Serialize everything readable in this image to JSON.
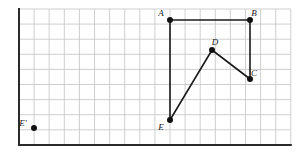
{
  "figure": {
    "background_color": "#ffffff",
    "grid": {
      "line_color": "#c9c9c9",
      "border_color": "#2b2b2b",
      "cell_size": 15.1,
      "origin_x": 19,
      "origin_y": 9,
      "columns": 18,
      "rows": 9,
      "left_axis": true,
      "bottom_axis": true
    },
    "shape": {
      "stroke_color": "#1a1a1a",
      "stroke_width": 1.6,
      "fill": "none",
      "closed": true,
      "point_radius": 3.0,
      "point_color": "#111111",
      "vertices": [
        {
          "label": "A",
          "x": 170,
          "y": 20,
          "label_dx": -9,
          "label_dy": -4
        },
        {
          "label": "B",
          "x": 250,
          "y": 20,
          "label_dx": 4,
          "label_dy": -4
        },
        {
          "label": "C",
          "x": 250,
          "y": 79,
          "label_dx": 4,
          "label_dy": -3
        },
        {
          "label": "D",
          "x": 212,
          "y": 50,
          "label_dx": 3,
          "label_dy": -5
        },
        {
          "label": "E",
          "x": 170,
          "y": 120,
          "label_dx": -9,
          "label_dy": 10
        }
      ],
      "edges": [
        {
          "from": "A",
          "to": "B"
        },
        {
          "from": "B",
          "to": "C"
        },
        {
          "from": "C",
          "to": "D"
        },
        {
          "from": "D",
          "to": "E"
        },
        {
          "from": "E",
          "to": "A"
        }
      ]
    },
    "extra_points": [
      {
        "label": "E'",
        "x": 34,
        "y": 128,
        "label_dx": -11,
        "label_dy": -2,
        "point_radius": 3.0,
        "point_color": "#111111"
      }
    ]
  }
}
